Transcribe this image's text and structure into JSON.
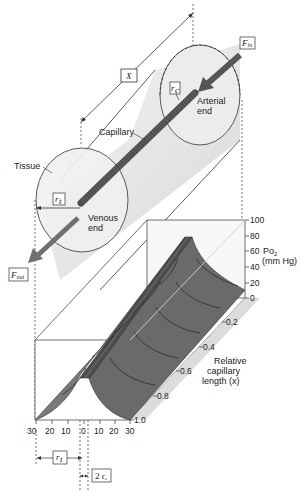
{
  "labels": {
    "x_length": "X",
    "f_in": "F",
    "f_in_sub": "in",
    "f_out": "F",
    "f_out_sub": "out",
    "r_c": "r",
    "r_c_sub": "c",
    "r_t": "r",
    "r_t_sub": "t",
    "arterial_end_1": "Arterial",
    "arterial_end_2": "end",
    "venous_end_1": "Venous",
    "venous_end_2": "end",
    "capillary": "Capillary",
    "tissue": "Tissue",
    "po2_label": "Po",
    "po2_sub": "2",
    "po2_units": "(mm Hg)",
    "rel_len_1": "Relative",
    "rel_len_2": "capillary",
    "rel_len_3": "length (x)",
    "two_rc": "2 r",
    "two_rc_sub": "c"
  },
  "axes": {
    "po2_ticks": [
      "100",
      "80",
      "60",
      "40",
      "20",
      "0"
    ],
    "length_ticks": [
      "0.2",
      "0.4",
      "0.6",
      "0.8",
      "1.0"
    ],
    "radial_ticks": [
      "30",
      "20",
      "10",
      "0",
      "10",
      "20",
      "30"
    ]
  },
  "colors": {
    "surface": "#6e6e6e",
    "surface_dark": "#555555",
    "capillary": "#5a5a5a",
    "tissue_fill": "#e6e6e6",
    "line": "#333333"
  }
}
